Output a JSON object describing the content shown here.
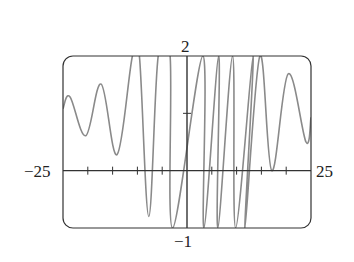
{
  "chart_data": {
    "type": "line",
    "title": "",
    "xlabel": "",
    "ylabel": "",
    "xlim": [
      -25,
      25
    ],
    "ylim": [
      -1,
      2
    ],
    "grid": false,
    "legend": null,
    "x_tick_step": 5,
    "y_tick_step": 1,
    "axis_labels": {
      "x_min": "−25",
      "x_max": "25",
      "y_max": "2",
      "y_min": "−1"
    },
    "series": [
      {
        "name": "f(x)",
        "points": [
          [
            -25,
            1.08
          ],
          [
            -23.6,
            1.29
          ],
          [
            -20.4,
            0.61
          ],
          [
            -17.3,
            1.51
          ],
          [
            -14.1,
            0.28
          ],
          [
            -11.0,
            2.0
          ],
          [
            -9.6,
            2.0
          ],
          [
            -7.7,
            -0.8
          ],
          [
            -5.8,
            2.0
          ],
          [
            -3.4,
            2.0
          ],
          [
            -2.9,
            -1.0
          ],
          [
            3.2,
            2.0
          ],
          [
            3.4,
            -1.0
          ],
          [
            6.4,
            2.0
          ],
          [
            6.2,
            -1.0
          ],
          [
            9.2,
            2.0
          ],
          [
            9.8,
            -1.0
          ],
          [
            13.3,
            2.0
          ],
          [
            11.7,
            -1.0
          ],
          [
            14.7,
            2.0
          ],
          [
            17.1,
            0.0
          ],
          [
            20.4,
            1.69
          ],
          [
            24.0,
            0.5
          ],
          [
            25,
            0.93
          ]
        ]
      }
    ],
    "colors": {
      "curve": "#8a8a8a",
      "axes": "#333333",
      "frame": "#333333"
    }
  }
}
